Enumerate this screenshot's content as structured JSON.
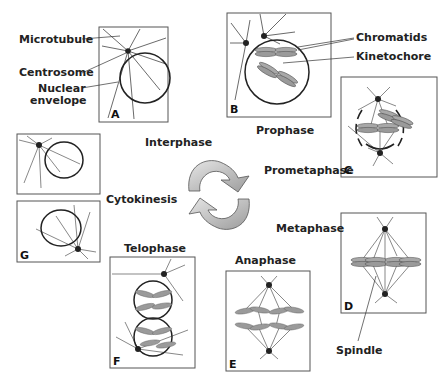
{
  "diagram": {
    "type": "cell-cycle-mitosis",
    "cycle_arrows": "circular-arrows-icon",
    "labels": {
      "microtubule": "Microtubule",
      "centrosome": "Centrosome",
      "nuclear_envelope_line1": "Nuclear",
      "nuclear_envelope_line2": "envelope",
      "chromatids": "Chromatids",
      "kinetochore": "Kinetochore",
      "spindle": "Spindle"
    },
    "phases": {
      "interphase": "Interphase",
      "prophase": "Prophase",
      "prometaphase": "Prometaphase",
      "metaphase": "Metaphase",
      "anaphase": "Anaphase",
      "telophase": "Telophase",
      "cytokinesis": "Cytokinesis"
    },
    "panels": [
      {
        "id": "A",
        "letter": "A",
        "phase": "Interphase"
      },
      {
        "id": "B",
        "letter": "B",
        "phase": "Prophase"
      },
      {
        "id": "C",
        "letter": "C",
        "phase": "Prometaphase"
      },
      {
        "id": "D",
        "letter": "D",
        "phase": "Metaphase"
      },
      {
        "id": "E",
        "letter": "E",
        "phase": "Anaphase"
      },
      {
        "id": "F",
        "letter": "F",
        "phase": "Telophase"
      },
      {
        "id": "G",
        "letter": "G",
        "phase": "Cytokinesis"
      }
    ],
    "colors": {
      "line": "#333333",
      "frame": "#555555",
      "chromosome": "#9a9a9a",
      "arrow_fill": "#b8b8b8"
    }
  }
}
